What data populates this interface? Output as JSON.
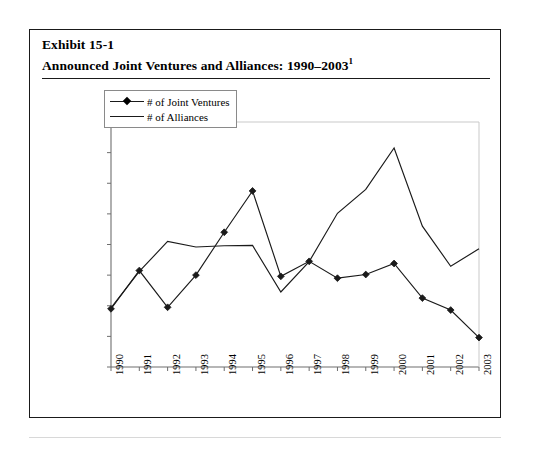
{
  "exhibit": {
    "label": "Exhibit 15-1",
    "title": "Announced Joint Ventures and Alliances: 1990–2003",
    "title_superscript": "1"
  },
  "legend": {
    "position": "top-left-inside-plot",
    "items": [
      {
        "label": "# of Joint Ventures",
        "marker": "diamond-marker-icon",
        "color": "#1a1a1a"
      },
      {
        "label": "# of Alliances",
        "marker": "plain-line-icon",
        "color": "#1a1a1a"
      }
    ]
  },
  "axes": {
    "y_ticks": [
      "8,000",
      "7,000",
      "6,000",
      "5,000",
      "4,000",
      "3,000",
      "2,000",
      "1,000",
      "0"
    ],
    "x_ticks": [
      "1990",
      "1991",
      "1992",
      "1993",
      "1994",
      "1995",
      "1996",
      "1997",
      "1998",
      "1999",
      "2000",
      "2001",
      "2002",
      "2003"
    ]
  },
  "chart_data": {
    "type": "line",
    "title": "Announced Joint Ventures and Alliances: 1990–2003",
    "xlabel": "",
    "ylabel": "",
    "ylim": [
      0,
      8000
    ],
    "ytick_step": 1000,
    "grid": false,
    "legend_position": "upper left",
    "categories": [
      "1990",
      "1991",
      "1992",
      "1993",
      "1994",
      "1995",
      "1996",
      "1997",
      "1998",
      "1999",
      "2000",
      "2001",
      "2002",
      "2003"
    ],
    "series": [
      {
        "name": "# of Joint Ventures",
        "marker": "diamond",
        "color": "#1a1a1a",
        "values": [
          1900,
          3150,
          1950,
          3000,
          4400,
          5750,
          2960,
          3450,
          2900,
          3020,
          3380,
          2250,
          1860,
          960
        ]
      },
      {
        "name": "# of Alliances",
        "marker": "none",
        "color": "#1a1a1a",
        "values": [
          1930,
          3120,
          4100,
          3920,
          3960,
          3970,
          2450,
          3440,
          5020,
          5800,
          7150,
          4600,
          3290,
          3860
        ]
      }
    ]
  }
}
